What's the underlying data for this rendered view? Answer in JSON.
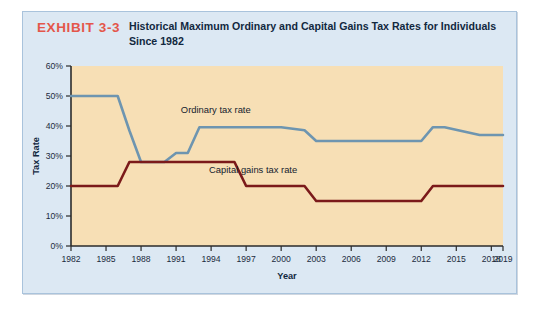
{
  "exhibit": {
    "number": "EXHIBIT 3-3",
    "title": "Historical Maximum Ordinary and Capital Gains Tax Rates for Individuals Since 1982",
    "number_color": "#E4564A",
    "title_color": "#12283F",
    "card_bg": "#DCE8F3",
    "card_border": "#A9C3DC"
  },
  "chart_data": {
    "type": "line",
    "title": "Historical Maximum Ordinary and Capital Gains Tax Rates for Individuals Since 1982",
    "xlabel": "Year",
    "ylabel": "Tax Rate",
    "xlim": [
      1982,
      2019
    ],
    "ylim": [
      0,
      60
    ],
    "grid": false,
    "plot_bg": "#F7DFB5",
    "axis_color": "#2B2B2B",
    "legend": "inline-annotations",
    "x_ticks": [
      1982,
      1985,
      1988,
      1991,
      1994,
      1997,
      2000,
      2003,
      2006,
      2009,
      2012,
      2015,
      2018,
      2019
    ],
    "x_tick_labels": [
      "1982",
      "1985",
      "1988",
      "1991",
      "1994",
      "1997",
      "2000",
      "2003",
      "2006",
      "2009",
      "2012",
      "2015",
      "2018",
      "2019"
    ],
    "y_ticks": [
      0,
      10,
      20,
      30,
      40,
      50,
      60
    ],
    "y_tick_labels": [
      "0%",
      "10%",
      "20%",
      "30%",
      "40%",
      "50%",
      "60%"
    ],
    "series": [
      {
        "name": "Ordinary tax rate",
        "color": "#6E95B0",
        "label_x": 1994.4,
        "label_y": 44.5,
        "points": [
          {
            "x": 1982,
            "y": 50
          },
          {
            "x": 1986,
            "y": 50
          },
          {
            "x": 1987,
            "y": 38.5
          },
          {
            "x": 1988,
            "y": 28
          },
          {
            "x": 1990,
            "y": 28
          },
          {
            "x": 1991,
            "y": 31
          },
          {
            "x": 1992,
            "y": 31
          },
          {
            "x": 1993,
            "y": 39.6
          },
          {
            "x": 2000,
            "y": 39.6
          },
          {
            "x": 2001,
            "y": 39.1
          },
          {
            "x": 2002,
            "y": 38.6
          },
          {
            "x": 2003,
            "y": 35
          },
          {
            "x": 2012,
            "y": 35
          },
          {
            "x": 2013,
            "y": 39.6
          },
          {
            "x": 2014,
            "y": 39.6
          },
          {
            "x": 2017,
            "y": 37
          },
          {
            "x": 2019,
            "y": 37
          }
        ]
      },
      {
        "name": "Capital gains tax rate",
        "color": "#7B1A1A",
        "label_x": 1997.6,
        "label_y": 24.5,
        "points": [
          {
            "x": 1982,
            "y": 20
          },
          {
            "x": 1986,
            "y": 20
          },
          {
            "x": 1987,
            "y": 28
          },
          {
            "x": 1996,
            "y": 28
          },
          {
            "x": 1997,
            "y": 20
          },
          {
            "x": 2002,
            "y": 20
          },
          {
            "x": 2003,
            "y": 15
          },
          {
            "x": 2012,
            "y": 15
          },
          {
            "x": 2013,
            "y": 20
          },
          {
            "x": 2019,
            "y": 20
          }
        ]
      }
    ]
  }
}
